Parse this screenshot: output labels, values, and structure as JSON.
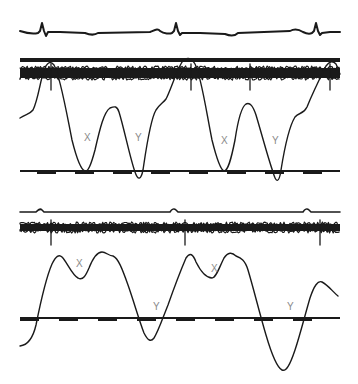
{
  "figure": {
    "colors": {
      "ink": "#1a1a1a",
      "label": "#8a8a8a",
      "background": "#ffffff"
    },
    "panels": [
      {
        "id": "upper",
        "ecg_beats": 3,
        "pressure_labels": [
          "X",
          "Y",
          "X",
          "Y"
        ],
        "baseline_marker_count": 8
      },
      {
        "id": "lower",
        "ecg_beats": 3,
        "pressure_labels": [
          "X",
          "Y",
          "X",
          "Y"
        ],
        "baseline_marker_count": 8
      }
    ]
  }
}
